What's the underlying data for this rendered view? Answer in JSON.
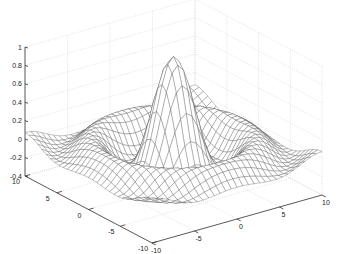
{
  "chart_data": {
    "type": "surface",
    "subtype": "mesh",
    "function": "sin(r)/r, r = sqrt(x^2 + y^2)",
    "title": "",
    "xlabel": "",
    "ylabel": "",
    "zlabel": "",
    "xlim": [
      -10,
      10
    ],
    "ylim": [
      -10,
      10
    ],
    "zlim": [
      -0.4,
      1
    ],
    "x_ticks": [
      -10,
      -5,
      0,
      5,
      10
    ],
    "y_ticks": [
      -10,
      -5,
      0,
      5,
      10
    ],
    "z_ticks": [
      -0.4,
      -0.2,
      0,
      0.2,
      0.4,
      0.6,
      0.8,
      1
    ],
    "x_tick_labels": [
      "-10",
      "-5",
      "0",
      "5",
      "10"
    ],
    "y_tick_labels": [
      "-10",
      "-5",
      "0",
      "5",
      "10"
    ],
    "z_tick_labels": [
      "-0.4",
      "-0.2",
      "0",
      "0.2",
      "0.4",
      "0.6",
      "0.8",
      "1"
    ],
    "grid": true,
    "grid_steps": 30,
    "peak": {
      "x": 0,
      "y": 0,
      "z": 1
    },
    "edge_color": "#555555",
    "face_color": "#ffffff",
    "grid_color": "#c8c8c8",
    "axis_color": "#333333",
    "legend": null
  }
}
